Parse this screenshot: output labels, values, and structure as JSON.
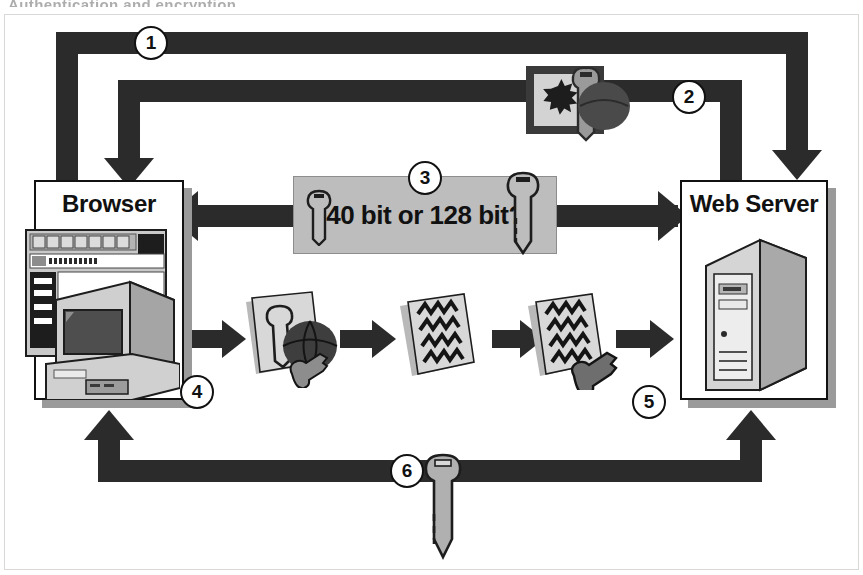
{
  "figure": {
    "cropped_heading": "Authentication and encryption",
    "background": "#ffffff",
    "ink": "#2b2b2b",
    "gray_box_fill": "#bdbdbd",
    "key_fill": "#a8a8a8"
  },
  "nodes": {
    "browser": {
      "label": "Browser",
      "icon": "desktop-computer-icon"
    },
    "server": {
      "label": "Web Server",
      "icon": "tower-server-icon"
    }
  },
  "caption": {
    "step3_text": "40 bit or 128 bit?",
    "left_icon": "key-icon",
    "right_icon": "key-icon"
  },
  "steps": [
    {
      "number": "1",
      "from": "browser",
      "to": "server",
      "direction": "right-then-down",
      "icon": null
    },
    {
      "number": "2",
      "from": "server",
      "to": "browser",
      "direction": "left-then-down",
      "icon": "certificate-with-key-icon"
    },
    {
      "number": "3",
      "from": "browser",
      "to": "server",
      "direction": "bidirectional",
      "icon": "key-icon"
    },
    {
      "number": "4",
      "from": "browser",
      "to": "server",
      "direction": "right",
      "icon": "document-key-globe-icon"
    },
    {
      "number": "5",
      "from": "browser",
      "to": "server",
      "direction": "right",
      "icon": "encrypted-document-key-icon"
    },
    {
      "number": "6",
      "from": "server",
      "to": "browser",
      "direction": "bidirectional-up",
      "icon": "key-icon"
    }
  ],
  "flow_icons": {
    "cert": {
      "name": "certificate-with-key-icon",
      "parts": [
        "document",
        "seal-starburst",
        "key"
      ]
    },
    "doc_key_globe": {
      "name": "document-key-globe-icon",
      "parts": [
        "page",
        "key-outline",
        "globe"
      ]
    },
    "encrypted_doc": {
      "name": "encrypted-document-icon",
      "parts": [
        "page",
        "zigzag-ciphertext"
      ]
    },
    "encrypted_doc_key": {
      "name": "encrypted-document-key-icon",
      "parts": [
        "page",
        "zigzag-ciphertext",
        "key"
      ]
    },
    "bottom_key": {
      "name": "key-icon",
      "parts": [
        "house-key"
      ]
    }
  }
}
